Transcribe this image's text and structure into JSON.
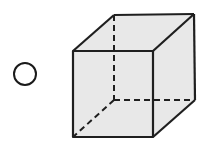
{
  "option": {
    "type": "radio",
    "selected": false,
    "label": ""
  },
  "figure": {
    "shape": "cube",
    "projection": "oblique",
    "hidden_edges_style": "dashed",
    "colors": {
      "face_fill": "#e8e8e8",
      "edge": "#1f1f1f",
      "background": "#ffffff"
    }
  }
}
